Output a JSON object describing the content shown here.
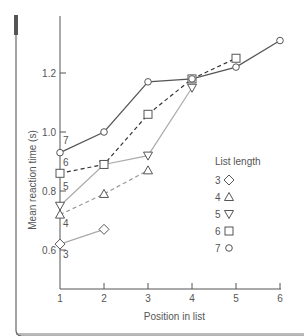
{
  "chart_data": {
    "type": "line",
    "title": "",
    "xlabel": "Position in list",
    "ylabel": "Mean reaction time (s)",
    "xlim": [
      1,
      6
    ],
    "ylim": [
      0.6,
      1.3
    ],
    "x_ticks": [
      "1",
      "2",
      "3",
      "4",
      "5",
      "6"
    ],
    "y_ticks": [
      "0.6",
      "0.8",
      "1.0",
      "1.2"
    ],
    "legend_title": "List length",
    "legend_position": "right-center",
    "grid": false,
    "series": [
      {
        "name": "3",
        "marker": "diamond",
        "line": "solid-gray",
        "x": [
          1,
          2
        ],
        "values": [
          0.62,
          0.67
        ]
      },
      {
        "name": "4",
        "marker": "triangle-up",
        "line": "dashed-gray",
        "x": [
          1,
          2,
          3
        ],
        "values": [
          0.72,
          0.79,
          0.87
        ]
      },
      {
        "name": "5",
        "marker": "triangle-down",
        "line": "solid-gray",
        "x": [
          1,
          2,
          3,
          4
        ],
        "values": [
          0.75,
          0.89,
          0.92,
          1.15
        ]
      },
      {
        "name": "6",
        "marker": "square",
        "line": "dashed-black",
        "x": [
          1,
          2,
          3,
          4,
          5
        ],
        "values": [
          0.86,
          0.89,
          1.06,
          1.18,
          1.25
        ]
      },
      {
        "name": "7",
        "marker": "circle",
        "line": "solid-black",
        "x": [
          1,
          2,
          3,
          4,
          5,
          6
        ],
        "values": [
          0.93,
          1.0,
          1.17,
          1.18,
          1.22,
          1.31
        ]
      }
    ],
    "annotations": [
      "7",
      "6",
      "5",
      "4",
      "3"
    ]
  }
}
